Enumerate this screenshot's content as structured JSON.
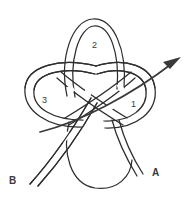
{
  "figure": {
    "type": "knot-diagram",
    "background_color": "#ffffff",
    "stroke_color": "#2e2e2e",
    "arrow_color": "#3a3a3a",
    "label_color": "#3a3a3a",
    "width": 190,
    "height": 205
  },
  "loop_labels": [
    {
      "id": "loop-1",
      "text": "1",
      "x": 131,
      "y": 100
    },
    {
      "id": "loop-2",
      "text": "2",
      "x": 92,
      "y": 41
    },
    {
      "id": "loop-3",
      "text": "3",
      "x": 42,
      "y": 96
    }
  ],
  "end_labels": [
    {
      "id": "end-a",
      "text": "A",
      "x": 152,
      "y": 168
    },
    {
      "id": "end-b",
      "text": "B",
      "x": 9,
      "y": 176
    }
  ],
  "arrow": {
    "name": "direction-arrow",
    "description": "arrow pointing up and to the right through loop 1",
    "tip_x": 181,
    "tip_y": 57
  }
}
